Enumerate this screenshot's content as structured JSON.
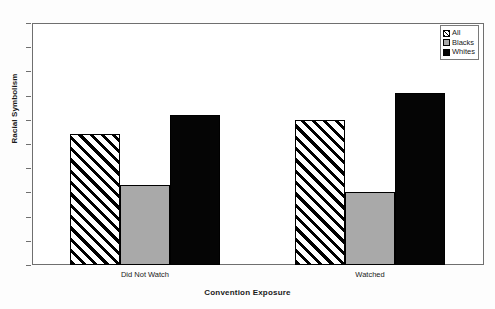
{
  "chart_data": {
    "type": "bar",
    "title": "",
    "xlabel": "Convention Exposure",
    "ylabel": "Racial Symbolism",
    "categories": [
      "Did Not Watch",
      "Watched"
    ],
    "series": [
      {
        "name": "All",
        "values": [
          0.54,
          0.6
        ],
        "color": "#000000",
        "pattern": "diagonal-hatch"
      },
      {
        "name": "Blacks",
        "values": [
          0.33,
          0.3
        ],
        "color": "#a9a9a9",
        "pattern": "solid"
      },
      {
        "name": "Whites",
        "values": [
          0.62,
          0.71
        ],
        "color": "#050505",
        "pattern": "solid"
      }
    ],
    "ylim": [
      0,
      1
    ],
    "ytick_labels": [
      "1",
      "0.9",
      "0.8",
      "0.7",
      "0.6",
      "0.5",
      "0.4",
      "0.3",
      "0.2",
      "0.1",
      "0"
    ],
    "ytick_values": [
      1,
      0.9,
      0.8,
      0.7,
      0.6,
      0.5,
      0.4,
      0.3,
      0.2,
      0.1,
      0
    ],
    "grid": false,
    "legend_position": "top-right",
    "legend_entries": [
      "All",
      "Blacks",
      "Whites"
    ]
  }
}
